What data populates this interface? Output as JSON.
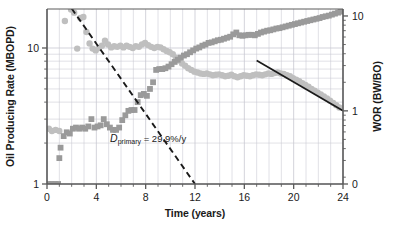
{
  "chart_data": {
    "type": "scatter",
    "title": "",
    "xlabel": "Time (years)",
    "ylabel": "Oil Producing Rate (MBOPD)",
    "y2label": "WOR (BW/BO)",
    "xlim": [
      0,
      24
    ],
    "ylim": [
      1,
      19.5
    ],
    "y2lim": [
      0.21,
      19.5
    ],
    "yscale": "log",
    "y2scale": "log",
    "grid": true,
    "legend": "none",
    "xticks": [
      0,
      4,
      8,
      12,
      16,
      20,
      24
    ],
    "xtick_labels": [
      "0",
      "4",
      "8",
      "12",
      "16",
      "20",
      "24"
    ],
    "yticks": [
      1,
      10
    ],
    "ytick_labels": [
      "1",
      "10"
    ],
    "y2ticks": [
      0,
      1,
      10
    ],
    "y2tick_labels": [
      "0",
      "1",
      "10"
    ],
    "annotations": [
      {
        "name": "primary-decline-label",
        "symbol": "D",
        "subscript": "primary",
        "text": " = 29.9%/y",
        "full_text": "Dprimary = 29.9%/y",
        "x": 8.2,
        "y": 2.05
      }
    ],
    "trend_lines": [
      {
        "name": "primary-decline-dashed-line",
        "style": "dashed",
        "color": "#1a1a1a",
        "axis": "left",
        "rate_percent_per_year": 29.9,
        "x_start": 2.0,
        "y_start": 19.5,
        "x_end": 12.0,
        "y_end": 1.0
      },
      {
        "name": "wor-decline-solid-line",
        "style": "solid",
        "color": "#1a1a1a",
        "axis": "left",
        "x_start": 17.0,
        "y_start": 8.1,
        "x_end": 24.0,
        "y_end": 3.45
      }
    ],
    "series": [
      {
        "name": "Oil Producing Rate",
        "axis": "left",
        "marker": "circle",
        "color": "#bfbfbf",
        "points": [
          [
            0.15,
            2.55
          ],
          [
            0.4,
            2.45
          ],
          [
            0.7,
            2.5
          ],
          [
            1.0,
            2.45
          ],
          [
            1.45,
            15.8
          ],
          [
            1.95,
            19.2
          ],
          [
            2.2,
            18.2
          ],
          [
            2.45,
            9.9
          ],
          [
            2.7,
            16.6
          ],
          [
            2.95,
            16.9
          ],
          [
            3.2,
            13.1
          ],
          [
            3.45,
            10.8
          ],
          [
            3.7,
            9.9
          ],
          [
            3.95,
            9.6
          ],
          [
            4.2,
            10.0
          ],
          [
            4.45,
            10.4
          ],
          [
            4.7,
            11.3
          ],
          [
            4.95,
            10.6
          ],
          [
            5.2,
            10.1
          ],
          [
            5.45,
            10.3
          ],
          [
            5.7,
            10.2
          ],
          [
            5.95,
            10.4
          ],
          [
            6.2,
            10.1
          ],
          [
            6.45,
            10.4
          ],
          [
            6.7,
            10.2
          ],
          [
            6.95,
            10.0
          ],
          [
            7.2,
            10.3
          ],
          [
            7.45,
            10.2
          ],
          [
            7.7,
            10.6
          ],
          [
            7.95,
            10.9
          ],
          [
            8.2,
            10.5
          ],
          [
            8.45,
            10.2
          ],
          [
            8.7,
            10.0
          ],
          [
            8.95,
            10.2
          ],
          [
            9.2,
            10.1
          ],
          [
            9.45,
            9.8
          ],
          [
            9.7,
            9.5
          ],
          [
            9.95,
            9.3
          ],
          [
            10.2,
            9.0
          ],
          [
            10.45,
            8.5
          ],
          [
            10.7,
            8.1
          ],
          [
            10.95,
            7.7
          ],
          [
            11.2,
            7.4
          ],
          [
            11.45,
            7.1
          ],
          [
            11.7,
            6.9
          ],
          [
            11.95,
            6.7
          ],
          [
            12.2,
            6.6
          ],
          [
            12.45,
            6.5
          ],
          [
            12.7,
            6.45
          ],
          [
            12.95,
            6.5
          ],
          [
            13.2,
            6.4
          ],
          [
            13.45,
            6.3
          ],
          [
            13.7,
            6.35
          ],
          [
            13.95,
            6.4
          ],
          [
            14.2,
            6.3
          ],
          [
            14.45,
            6.2
          ],
          [
            14.7,
            6.25
          ],
          [
            14.95,
            6.35
          ],
          [
            15.2,
            6.2
          ],
          [
            15.45,
            6.1
          ],
          [
            15.7,
            6.2
          ],
          [
            15.95,
            6.3
          ],
          [
            16.2,
            6.25
          ],
          [
            16.45,
            6.2
          ],
          [
            16.7,
            6.3
          ],
          [
            16.95,
            6.4
          ],
          [
            17.2,
            6.35
          ],
          [
            17.45,
            6.3
          ],
          [
            17.7,
            6.4
          ],
          [
            17.95,
            6.5
          ],
          [
            18.2,
            6.45
          ],
          [
            18.45,
            6.55
          ],
          [
            18.7,
            6.6
          ],
          [
            18.95,
            6.5
          ],
          [
            19.2,
            6.45
          ],
          [
            19.45,
            6.3
          ],
          [
            19.7,
            6.2
          ],
          [
            19.95,
            6.0
          ],
          [
            20.2,
            5.85
          ],
          [
            20.45,
            5.7
          ],
          [
            20.7,
            5.5
          ],
          [
            20.95,
            5.35
          ],
          [
            21.2,
            5.2
          ],
          [
            21.45,
            5.0
          ],
          [
            21.7,
            4.85
          ],
          [
            21.95,
            4.7
          ],
          [
            22.2,
            4.55
          ],
          [
            22.45,
            4.4
          ],
          [
            22.7,
            4.25
          ],
          [
            22.95,
            4.1
          ],
          [
            23.2,
            3.95
          ],
          [
            23.45,
            3.8
          ],
          [
            23.7,
            3.65
          ]
        ]
      },
      {
        "name": "WOR",
        "axis": "left",
        "marker": "square",
        "color": "#9a9a9a",
        "points": [
          [
            0.15,
            1.0
          ],
          [
            0.4,
            1.0
          ],
          [
            0.65,
            1.0
          ],
          [
            0.9,
            1.0
          ],
          [
            1.0,
            1.55
          ],
          [
            1.1,
            1.85
          ],
          [
            1.35,
            2.25
          ],
          [
            1.6,
            2.4
          ],
          [
            1.85,
            2.35
          ],
          [
            2.1,
            2.55
          ],
          [
            2.35,
            2.6
          ],
          [
            2.6,
            2.55
          ],
          [
            2.85,
            2.6
          ],
          [
            3.1,
            2.55
          ],
          [
            3.35,
            2.65
          ],
          [
            3.6,
            3.0
          ],
          [
            3.85,
            2.6
          ],
          [
            4.1,
            2.65
          ],
          [
            4.35,
            2.7
          ],
          [
            4.6,
            3.0
          ],
          [
            4.85,
            2.75
          ],
          [
            5.1,
            2.6
          ],
          [
            5.35,
            2.5
          ],
          [
            5.6,
            2.5
          ],
          [
            5.85,
            2.6
          ],
          [
            6.1,
            2.95
          ],
          [
            6.35,
            3.2
          ],
          [
            6.6,
            3.45
          ],
          [
            6.85,
            3.5
          ],
          [
            7.1,
            3.5
          ],
          [
            7.35,
            4.0
          ],
          [
            7.6,
            4.5
          ],
          [
            7.85,
            4.6
          ],
          [
            8.1,
            4.45
          ],
          [
            8.35,
            5.0
          ],
          [
            8.6,
            5.6
          ],
          [
            8.85,
            6.9
          ],
          [
            9.1,
            7.0
          ],
          [
            9.35,
            7.0
          ],
          [
            9.6,
            7.1
          ],
          [
            9.85,
            7.3
          ],
          [
            10.1,
            7.6
          ],
          [
            10.35,
            7.9
          ],
          [
            10.6,
            8.2
          ],
          [
            10.85,
            8.5
          ],
          [
            11.1,
            8.8
          ],
          [
            11.35,
            9.0
          ],
          [
            11.6,
            9.3
          ],
          [
            11.85,
            9.6
          ],
          [
            12.1,
            9.9
          ],
          [
            12.35,
            10.1
          ],
          [
            12.6,
            10.4
          ],
          [
            12.85,
            10.6
          ],
          [
            13.1,
            10.9
          ],
          [
            13.35,
            11.0
          ],
          [
            13.6,
            11.2
          ],
          [
            13.85,
            11.4
          ],
          [
            14.1,
            11.5
          ],
          [
            14.35,
            11.7
          ],
          [
            14.6,
            11.9
          ],
          [
            14.85,
            12.1
          ],
          [
            15.1,
            12.6
          ],
          [
            15.35,
            13.0
          ],
          [
            15.6,
            12.4
          ],
          [
            15.85,
            12.3
          ],
          [
            16.1,
            12.4
          ],
          [
            16.35,
            12.5
          ],
          [
            16.6,
            12.5
          ],
          [
            16.85,
            12.4
          ],
          [
            17.1,
            12.7
          ],
          [
            17.35,
            13.0
          ],
          [
            17.6,
            13.2
          ],
          [
            17.85,
            13.4
          ],
          [
            18.1,
            13.5
          ],
          [
            18.35,
            13.7
          ],
          [
            18.6,
            13.9
          ],
          [
            18.85,
            14.0
          ],
          [
            19.1,
            14.2
          ],
          [
            19.35,
            14.4
          ],
          [
            19.6,
            14.6
          ],
          [
            19.85,
            14.8
          ],
          [
            20.1,
            15.0
          ],
          [
            20.35,
            15.2
          ],
          [
            20.6,
            15.4
          ],
          [
            20.85,
            15.6
          ],
          [
            21.1,
            15.8
          ],
          [
            21.35,
            16.0
          ],
          [
            21.6,
            16.2
          ],
          [
            21.85,
            16.4
          ],
          [
            22.1,
            16.6
          ],
          [
            22.35,
            16.9
          ],
          [
            22.6,
            17.1
          ],
          [
            22.85,
            17.3
          ],
          [
            23.1,
            17.6
          ],
          [
            23.35,
            17.9
          ],
          [
            23.6,
            18.2
          ],
          [
            23.8,
            18.5
          ]
        ]
      }
    ],
    "colors": {
      "oil_rate": "#bfbfbf",
      "wor": "#9a9a9a",
      "axis": "#5a5a5a",
      "grid": "#c8c8d2",
      "text": "#1a1a1a"
    }
  }
}
